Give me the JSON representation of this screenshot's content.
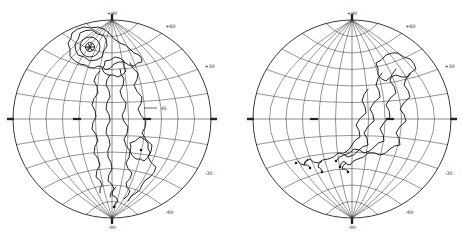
{
  "figure": {
    "paper_color": "#ffffff",
    "ink_color": "#222222",
    "graticule_color": "#3c3c3c",
    "contour_color": "#1a1a1a"
  },
  "chart_data": [
    {
      "id": "left-hemisphere",
      "type": "contour",
      "projection": "globular-equatorial-hemisphere",
      "grid": {
        "parallel_step_deg": 15,
        "meridian_step_deg": 15,
        "grid_on": true
      },
      "rim_labels": [
        {
          "angle_deg": 90,
          "text": "+90"
        },
        {
          "angle_deg": 60,
          "text": "+60"
        },
        {
          "angle_deg": 30,
          "text": "+30"
        },
        {
          "angle_deg": -30,
          "text": "-30"
        },
        {
          "angle_deg": -60,
          "text": "-60"
        },
        {
          "angle_deg": -90,
          "text": "-90"
        }
      ],
      "cardinal_ticks_deg": [
        0,
        90,
        180,
        270
      ],
      "equator_bold_tick_x": [
        -35,
        35
      ],
      "marker": {
        "type": "star",
        "x": -22,
        "y": -72,
        "rings": [
          4.5,
          10
        ]
      },
      "contour_label": {
        "text": "45",
        "x": 49,
        "y": -11,
        "leader_from_x": 32,
        "leader_to_x": 45
      },
      "contours_closed": [
        [
          [
            -37,
            -75
          ],
          [
            -32,
            -86
          ],
          [
            -20,
            -89
          ],
          [
            -8,
            -83
          ],
          [
            -5,
            -73
          ],
          [
            -10,
            -62
          ],
          [
            -22,
            -58
          ],
          [
            -34,
            -64
          ]
        ],
        [
          [
            -44,
            -76
          ],
          [
            -40,
            -86
          ],
          [
            -28,
            -92
          ],
          [
            -14,
            -92
          ],
          [
            -3,
            -86
          ],
          [
            8,
            -76
          ],
          [
            18,
            -70
          ],
          [
            27,
            -64
          ],
          [
            30,
            -57
          ],
          [
            22,
            -53
          ],
          [
            12,
            -57
          ],
          [
            2,
            -55
          ],
          [
            -6,
            -49
          ],
          [
            -14,
            -53
          ],
          [
            -22,
            -51
          ],
          [
            -32,
            -55
          ],
          [
            -42,
            -63
          ]
        ],
        [
          [
            -7,
            -58
          ],
          [
            3,
            -62
          ],
          [
            12,
            -58
          ],
          [
            14,
            -48
          ],
          [
            6,
            -42
          ],
          [
            -4,
            -44
          ],
          [
            -10,
            -50
          ]
        ],
        [
          [
            18,
            24
          ],
          [
            28,
            18
          ],
          [
            36,
            24
          ],
          [
            38,
            34
          ],
          [
            32,
            42
          ],
          [
            24,
            40
          ],
          [
            18,
            32
          ]
        ]
      ],
      "contours_open": [
        [
          [
            -12,
            -48
          ],
          [
            -18,
            -38
          ],
          [
            -14,
            -26
          ],
          [
            -20,
            -14
          ],
          [
            -16,
            -2
          ],
          [
            -20,
            10
          ],
          [
            -14,
            22
          ],
          [
            -18,
            34
          ],
          [
            -12,
            46
          ],
          [
            -16,
            58
          ],
          [
            -10,
            66
          ],
          [
            -12,
            74
          ]
        ],
        [
          [
            -2,
            -44
          ],
          [
            -6,
            -34
          ],
          [
            -2,
            -22
          ],
          [
            -6,
            -10
          ],
          [
            -2,
            2
          ],
          [
            -6,
            14
          ],
          [
            -2,
            26
          ],
          [
            -4,
            38
          ],
          [
            0,
            50
          ],
          [
            -4,
            62
          ],
          [
            2,
            70
          ],
          [
            -2,
            78
          ]
        ],
        [
          [
            8,
            -50
          ],
          [
            12,
            -40
          ],
          [
            8,
            -28
          ],
          [
            14,
            -16
          ],
          [
            10,
            -4
          ],
          [
            16,
            8
          ],
          [
            12,
            20
          ],
          [
            18,
            32
          ],
          [
            14,
            44
          ],
          [
            20,
            54
          ],
          [
            14,
            64
          ],
          [
            18,
            72
          ],
          [
            12,
            80
          ]
        ],
        [
          [
            18,
            -56
          ],
          [
            26,
            -46
          ],
          [
            22,
            -34
          ],
          [
            30,
            -22
          ],
          [
            26,
            -10
          ],
          [
            34,
            2
          ],
          [
            30,
            14
          ],
          [
            40,
            26
          ],
          [
            36,
            38
          ],
          [
            44,
            48
          ],
          [
            38,
            58
          ],
          [
            30,
            66
          ],
          [
            24,
            74
          ],
          [
            16,
            82
          ]
        ],
        [
          [
            4,
            68
          ],
          [
            0,
            76
          ],
          [
            6,
            82
          ],
          [
            2,
            88
          ]
        ]
      ],
      "end_dots": [
        [
          29,
          31
        ],
        [
          2,
          88
        ]
      ]
    },
    {
      "id": "right-hemisphere",
      "type": "contour",
      "projection": "globular-equatorial-hemisphere",
      "grid": {
        "parallel_step_deg": 15,
        "meridian_step_deg": 15,
        "grid_on": true
      },
      "rim_labels": [
        {
          "angle_deg": 90,
          "text": "+90"
        },
        {
          "angle_deg": 60,
          "text": "+60"
        },
        {
          "angle_deg": 30,
          "text": "+30"
        },
        {
          "angle_deg": -30,
          "text": "-30"
        },
        {
          "angle_deg": -60,
          "text": "-60"
        },
        {
          "angle_deg": -90,
          "text": "-90"
        }
      ],
      "cardinal_ticks_deg": [
        0,
        90,
        180,
        270
      ],
      "equator_bold_tick_x": [
        -38,
        38
      ],
      "marker": null,
      "contour_label": null,
      "contours_closed": [
        [
          [
            24,
            -56
          ],
          [
            34,
            -64
          ],
          [
            46,
            -66
          ],
          [
            58,
            -60
          ],
          [
            64,
            -50
          ],
          [
            56,
            -42
          ],
          [
            44,
            -44
          ],
          [
            34,
            -38
          ],
          [
            26,
            -44
          ]
        ]
      ],
      "contours_open": [
        [
          [
            58,
            -46
          ],
          [
            52,
            -34
          ],
          [
            58,
            -22
          ],
          [
            48,
            -10
          ],
          [
            54,
            2
          ],
          [
            44,
            14
          ],
          [
            48,
            26
          ],
          [
            38,
            30
          ],
          [
            28,
            36
          ],
          [
            16,
            34
          ],
          [
            6,
            40
          ],
          [
            -2,
            46
          ],
          [
            -8,
            42
          ],
          [
            -12,
            48
          ]
        ],
        [
          [
            44,
            -50
          ],
          [
            38,
            -38
          ],
          [
            44,
            -26
          ],
          [
            34,
            -14
          ],
          [
            38,
            -2
          ],
          [
            28,
            10
          ],
          [
            32,
            22
          ],
          [
            22,
            28
          ],
          [
            12,
            34
          ],
          [
            2,
            30
          ],
          [
            -8,
            36
          ],
          [
            -16,
            42
          ]
        ],
        [
          [
            30,
            -46
          ],
          [
            24,
            -34
          ],
          [
            28,
            -22
          ],
          [
            18,
            -10
          ],
          [
            22,
            2
          ],
          [
            12,
            14
          ],
          [
            16,
            26
          ],
          [
            6,
            32
          ],
          [
            -4,
            38
          ],
          [
            -14,
            34
          ],
          [
            -24,
            40
          ],
          [
            -34,
            44
          ],
          [
            -42,
            40
          ],
          [
            -48,
            46
          ],
          [
            -54,
            42
          ]
        ],
        [
          [
            16,
            -30
          ],
          [
            10,
            -18
          ],
          [
            14,
            -6
          ],
          [
            4,
            6
          ],
          [
            8,
            18
          ],
          [
            0,
            26
          ],
          [
            -8,
            34
          ]
        ],
        [
          [
            -30,
            42
          ],
          [
            -34,
            48
          ],
          [
            -30,
            52
          ]
        ],
        [
          [
            -44,
            40
          ],
          [
            -48,
            46
          ],
          [
            -42,
            48
          ]
        ],
        [
          [
            -6,
            44
          ],
          [
            -10,
            50
          ],
          [
            -4,
            52
          ]
        ]
      ],
      "end_dots": [
        [
          -12,
          48
        ],
        [
          -16,
          42
        ],
        [
          -56,
          44
        ],
        [
          -30,
          53
        ],
        [
          -42,
          49
        ],
        [
          -4,
          53
        ]
      ]
    }
  ]
}
